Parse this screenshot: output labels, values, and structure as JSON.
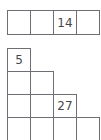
{
  "puzzle_top": {
    "rows": [
      [
        "",
        "",
        "14",
        ""
      ]
    ]
  },
  "puzzle_bottom": {
    "rows": [
      [
        "5"
      ],
      [
        "",
        ""
      ],
      [
        "",
        "",
        "27"
      ],
      [
        "",
        "",
        "",
        ""
      ]
    ]
  },
  "colors": {
    "grid_line": "#6d6f74",
    "text": "#45474c",
    "background": "#ffffff"
  }
}
